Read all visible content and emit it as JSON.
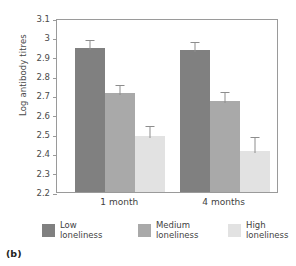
{
  "figure": {
    "panel_label": "(b)"
  },
  "chart_data": {
    "type": "bar",
    "title": "",
    "xlabel": "",
    "ylabel": "Log antibody titres",
    "categories": [
      "1 month",
      "4 months"
    ],
    "ylim": [
      2.2,
      3.1
    ],
    "yticks": [
      "2.2",
      "2.3",
      "2.4",
      "2.5",
      "2.6",
      "2.7",
      "2.8",
      "2.9",
      "3",
      "3.1"
    ],
    "ytick_values": [
      2.2,
      2.3,
      2.4,
      2.5,
      2.6,
      2.7,
      2.8,
      2.9,
      3.0,
      3.1
    ],
    "grid": false,
    "legend_position": "below",
    "errorbars": "shown",
    "series": [
      {
        "name": "Low loneliness",
        "color": "#808080",
        "values": [
          2.945,
          2.932
        ],
        "err_upper": [
          0.052,
          0.055
        ],
        "err_lower": [
          0.0,
          0.0
        ]
      },
      {
        "name": "Medium loneliness",
        "color": "#a9a9a9",
        "values": [
          2.714,
          2.672
        ],
        "err_upper": [
          0.048,
          0.057
        ],
        "err_lower": [
          0.0,
          0.0
        ]
      },
      {
        "name": "High loneliness",
        "color": "#e2e2e2",
        "values": [
          2.49,
          2.414
        ],
        "err_upper": [
          0.06,
          0.083
        ],
        "err_lower": [
          0.0,
          0.0
        ]
      }
    ]
  },
  "legend": [
    {
      "label": "Low\nloneliness",
      "color": "#808080"
    },
    {
      "label": "Medium\nloneliness",
      "color": "#a9a9a9"
    },
    {
      "label": "High\nloneliness",
      "color": "#e2e2e2"
    }
  ]
}
